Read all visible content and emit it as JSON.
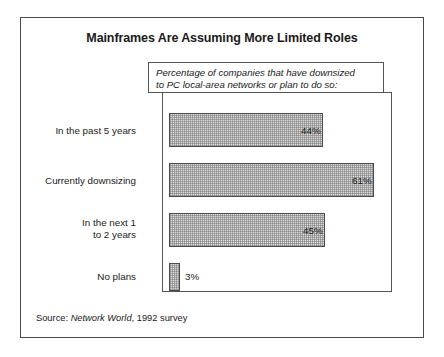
{
  "figure": {
    "title": "Mainframes Are Assuming More Limited Roles",
    "caption": "Percentage of companies that have downsized\nto PC local-area networks or plan to do so:",
    "source_prefix": "Source:",
    "source_publication": "Network World",
    "source_suffix": ", 1992 survey"
  },
  "chart_data": {
    "type": "bar",
    "orientation": "horizontal",
    "title": "Mainframes Are Assuming More Limited Roles",
    "subtitle": "Percentage of companies that have downsized to PC local-area networks or plan to do so:",
    "xlabel": "",
    "ylabel": "",
    "grid": false,
    "legend": "none",
    "xlim": [
      0,
      67
    ],
    "unit": "%",
    "categories": [
      "In the past 5 years",
      "Currently downsizing",
      "In the next 1\nto 2 years",
      "No plans"
    ],
    "values": [
      44,
      61,
      45,
      3
    ],
    "data_labels": [
      "44%",
      "61%",
      "45%",
      "3%"
    ],
    "source": "Source: Network World, 1992 survey"
  },
  "bar_geometry": [
    {
      "top": 113,
      "height": 34,
      "width": 154,
      "label_top": 125,
      "value_x": 301,
      "value_y": 125
    },
    {
      "top": 163,
      "height": 34,
      "width": 205,
      "label_top": 175,
      "value_x": 352,
      "value_y": 175
    },
    {
      "top": 213,
      "height": 34,
      "width": 156,
      "label_top": 217,
      "value_x": 303,
      "value_y": 225
    },
    {
      "top": 263,
      "height": 28,
      "width": 11,
      "label_top": 271,
      "value_x": 185,
      "value_y": 271
    }
  ],
  "colors": {
    "bar_fill": "#dcdcdc",
    "bar_border": "#4c4c4c",
    "frame": "#555555",
    "outer_border": "#4a4a4a",
    "text": "#1a1a1a",
    "background": "#ffffff"
  }
}
